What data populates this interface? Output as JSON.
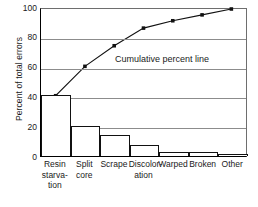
{
  "chart_data": {
    "type": "bar",
    "title": "",
    "xlabel": "",
    "ylabel": "Percent of total errors",
    "ylim": [
      0,
      100
    ],
    "yticks": [
      0,
      20,
      40,
      60,
      80,
      100
    ],
    "grid": true,
    "legend": "none",
    "categories": [
      "Resin starvation",
      "Split core",
      "Scrape",
      "Discoloration",
      "Warped",
      "Broken",
      "Other"
    ],
    "category_label_lines": [
      [
        "Resin",
        "starva-",
        "tion"
      ],
      [
        "Split",
        "core"
      ],
      [
        "Scrape"
      ],
      [
        "Discolor-",
        "ation"
      ],
      [
        "Warped"
      ],
      [
        "Broken"
      ],
      [
        "Other"
      ]
    ],
    "values": [
      41,
      20,
      14,
      7.5,
      3,
      3,
      1.5
    ],
    "series": [
      {
        "name": "Percent of total errors",
        "type": "bar",
        "values": [
          41,
          20,
          14,
          7.5,
          3,
          3,
          1.5
        ]
      },
      {
        "name": "Cumulative percent line",
        "type": "line",
        "values": [
          41,
          61,
          75,
          87,
          92,
          96,
          100
        ]
      }
    ],
    "annotations": [
      {
        "text": "Cumulative percent line",
        "x": 3.2,
        "y": 68
      }
    ]
  },
  "axis": {
    "y_title": "Percent of total errors",
    "y_tick_labels": [
      "100",
      "80",
      "60",
      "40",
      "20",
      "0"
    ]
  },
  "annotation": {
    "cumulative_line": "Cumulative percent line"
  },
  "colors": {
    "bar_stroke": "#111111",
    "bar_fill": "#ffffff",
    "gridline": "#8c8c8c",
    "line": "#111111",
    "axis": "#000000",
    "text": "#1a1a1a"
  }
}
